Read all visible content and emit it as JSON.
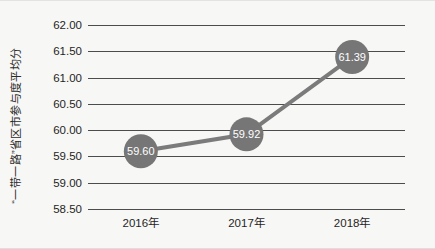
{
  "chart_data": {
    "type": "line",
    "title": "",
    "subtitle": "",
    "xlabel": "",
    "ylabel": "“一带一路”省区市参与度平均分",
    "categories": [
      "2016年",
      "2017年",
      "2018年"
    ],
    "series": [
      {
        "name": "“一带一路”省区市参与度平均分",
        "values": [
          59.6,
          59.92,
          61.39
        ],
        "point_labels": [
          "59.60",
          "59.92",
          "61.39"
        ],
        "line_color": "#7b7b7b",
        "marker_color": "#767676",
        "marker_shape": "circle"
      }
    ],
    "ylim": [
      58.5,
      62.0
    ],
    "ytick_step": 0.5,
    "ytick_labels": [
      "62.00",
      "61.50",
      "61.00",
      "60.50",
      "60.00",
      "59.50",
      "59.00",
      "58.50"
    ],
    "ytick_values": [
      62.0,
      61.5,
      61.0,
      60.5,
      60.0,
      59.5,
      59.0,
      58.5
    ],
    "grid": true,
    "grid_color": "#4c4c4c",
    "legend": false,
    "legend_position": "none",
    "background_color": "#f7f7f5",
    "text_color": "#1f1f1f"
  }
}
